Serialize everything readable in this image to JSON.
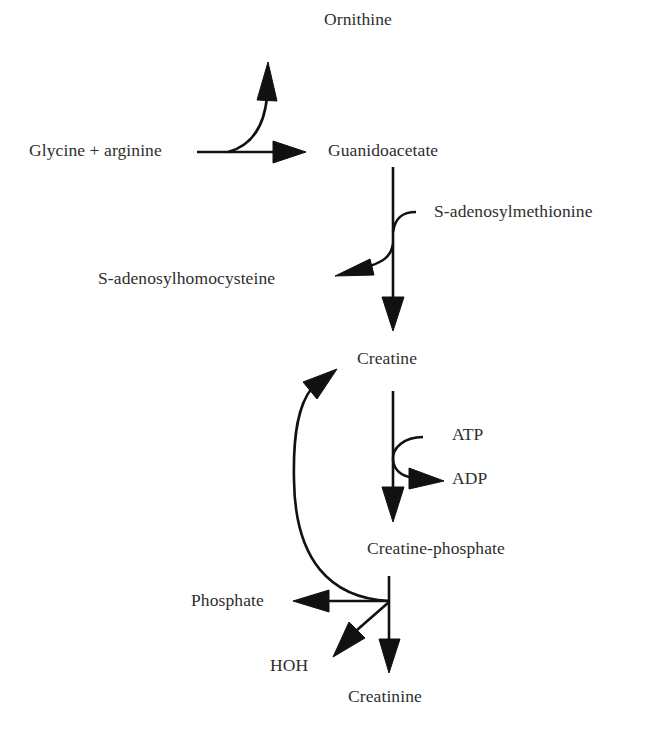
{
  "diagram": {
    "type": "metabolic-pathway",
    "nodes": {
      "glycine_arginine": "Glycine + arginine",
      "ornithine": "Ornithine",
      "guanidoacetate": "Guanidoacetate",
      "s_adenosylmethionine": "S-adenosylmethionine",
      "s_adenosylhomocysteine": "S-adenosylhomocysteine",
      "creatine": "Creatine",
      "atp": "ATP",
      "adp": "ADP",
      "creatine_phosphate": "Creatine-phosphate",
      "phosphate": "Phosphate",
      "hoh": "HOH",
      "creatinine": "Creatinine"
    },
    "edges": [
      {
        "from": "Glycine + arginine",
        "to": "Guanidoacetate",
        "side_product": "Ornithine"
      },
      {
        "from": "Guanidoacetate",
        "to": "Creatine",
        "cofactor_in": "S-adenosylmethionine",
        "cofactor_out": "S-adenosylhomocysteine"
      },
      {
        "from": "Creatine",
        "to": "Creatine-phosphate",
        "cofactor_in": "ATP",
        "cofactor_out": "ADP"
      },
      {
        "from": "Creatine-phosphate",
        "to": "Creatinine",
        "side_products": [
          "Phosphate",
          "HOH"
        ]
      },
      {
        "from": "Creatine-phosphate",
        "to": "Creatine",
        "style": "curved-return"
      }
    ],
    "colors": {
      "text": "#2e2e2e",
      "arrows": "#111111",
      "background": "#ffffff"
    }
  }
}
